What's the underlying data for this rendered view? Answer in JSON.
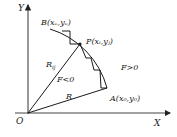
{
  "diagram": {
    "type": "circular-arc-interpolation",
    "axes": {
      "x_label": "X",
      "y_label": "Y",
      "origin_label": "O"
    },
    "points": {
      "start": {
        "name": "A",
        "coords": "(x0,y0)",
        "label": "A(x₀,y₀)"
      },
      "end": {
        "name": "B",
        "coords": "(xe,ye)",
        "label": "B(xₑ,yₑ)"
      },
      "current": {
        "name": "P",
        "coords": "(xi,yj)",
        "label": "P(xᵢ,yⱼ)"
      }
    },
    "radius_labels": {
      "radius": "R",
      "radius_point": "R",
      "radius_point_sub": "ij"
    },
    "regions": {
      "inside": "F<0",
      "outside": "F>0"
    },
    "colors": {
      "stroke": "#1a1a1a",
      "axis": "#333333",
      "background": "#ffffff"
    }
  }
}
